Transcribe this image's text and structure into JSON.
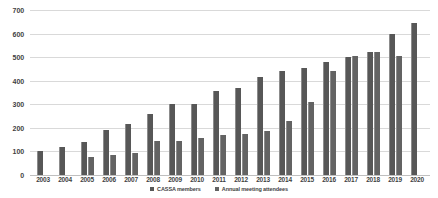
{
  "chart_data": {
    "type": "bar",
    "title": "",
    "xlabel": "",
    "ylabel": "",
    "ylim": [
      0,
      700
    ],
    "y_ticks": [
      700,
      600,
      500,
      400,
      300,
      200,
      100,
      0
    ],
    "grid": true,
    "legend_position": "bottom",
    "categories": [
      "2003",
      "2004",
      "2005",
      "2006",
      "2007",
      "2008",
      "2009",
      "2010",
      "2011",
      "2012",
      "2013",
      "2014",
      "2015",
      "2016",
      "2017",
      "2018",
      "2019",
      "2020"
    ],
    "series": [
      {
        "name": "CASSA members",
        "color": "#575757",
        "values": [
          100,
          120,
          140,
          190,
          215,
          260,
          300,
          300,
          355,
          370,
          415,
          440,
          455,
          480,
          500,
          520,
          600,
          645
        ]
      },
      {
        "name": "Annual meeting attendees",
        "color": "#636363",
        "values": [
          null,
          null,
          75,
          85,
          95,
          145,
          145,
          155,
          170,
          175,
          185,
          230,
          310,
          440,
          505,
          520,
          505,
          null
        ]
      }
    ]
  },
  "legend": {
    "items": [
      {
        "label": "CASSA members"
      },
      {
        "label": "Annual meeting attendees"
      }
    ]
  }
}
